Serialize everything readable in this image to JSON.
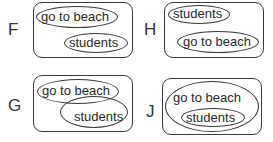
{
  "options": [
    {
      "letter": "F",
      "sets": [
        "go to beach",
        "students"
      ],
      "relation": "disjoint"
    },
    {
      "letter": "H",
      "sets": [
        "students",
        "go to beach"
      ],
      "relation": "disjoint"
    },
    {
      "letter": "G",
      "sets": [
        "go to beach",
        "students"
      ],
      "relation": "overlapping"
    },
    {
      "letter": "J",
      "sets": [
        "go to beach",
        "students"
      ],
      "relation": "students subset of go to beach"
    }
  ],
  "colors": {
    "stroke": "#3a3a3a",
    "text": "#2a2a2a",
    "background": "#ffffff"
  }
}
